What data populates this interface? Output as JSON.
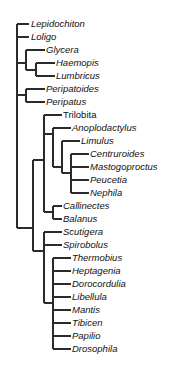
{
  "figure": {
    "type": "cladogram",
    "title": "",
    "background_color": "#ffffff",
    "line_color": "#2b2b2b",
    "text_color": "#111111",
    "width": 181,
    "height": 370
  },
  "chart_data": {
    "type": "tree",
    "title": "",
    "xlabel": "",
    "ylabel": "",
    "orientation": "left-to-right",
    "grid": false,
    "legend": false,
    "taxa": [
      {
        "label": "Lepidochiton",
        "italic": true,
        "x": 31,
        "y": 24,
        "tick_x": 22
      },
      {
        "label": "Loligo",
        "italic": true,
        "x": 31,
        "y": 37,
        "tick_x": 22
      },
      {
        "label": "Glycera",
        "italic": true,
        "x": 46,
        "y": 50,
        "tick_x": 38
      },
      {
        "label": "Haemopis",
        "italic": true,
        "x": 56,
        "y": 63,
        "tick_x": 48
      },
      {
        "label": "Lumbricus",
        "italic": true,
        "x": 56,
        "y": 76,
        "tick_x": 48
      },
      {
        "label": "Peripatoides",
        "italic": true,
        "x": 46,
        "y": 89,
        "tick_x": 38
      },
      {
        "label": "Peripatus",
        "italic": true,
        "x": 46,
        "y": 102,
        "tick_x": 38
      },
      {
        "label": "Trilobita",
        "italic": false,
        "x": 63,
        "y": 115,
        "tick_x": 55
      },
      {
        "label": "Anoplodactylus",
        "italic": true,
        "x": 72,
        "y": 128,
        "tick_x": 64
      },
      {
        "label": "Limulus",
        "italic": true,
        "x": 81,
        "y": 141,
        "tick_x": 73
      },
      {
        "label": "Centruroides",
        "italic": true,
        "x": 90,
        "y": 154,
        "tick_x": 82
      },
      {
        "label": "Mastogoproctus",
        "italic": true,
        "x": 90,
        "y": 167,
        "tick_x": 82
      },
      {
        "label": "Peucetia",
        "italic": true,
        "x": 90,
        "y": 180,
        "tick_x": 82
      },
      {
        "label": "Nephila",
        "italic": true,
        "x": 90,
        "y": 193,
        "tick_x": 82
      },
      {
        "label": "Callinectes",
        "italic": true,
        "x": 63,
        "y": 206,
        "tick_x": 55
      },
      {
        "label": "Balanus",
        "italic": true,
        "x": 63,
        "y": 219,
        "tick_x": 55
      },
      {
        "label": "Scutigera",
        "italic": true,
        "x": 63,
        "y": 232,
        "tick_x": 55
      },
      {
        "label": "Spirobolus",
        "italic": true,
        "x": 63,
        "y": 245,
        "tick_x": 55
      },
      {
        "label": "Thermobius",
        "italic": true,
        "x": 72,
        "y": 258,
        "tick_x": 64
      },
      {
        "label": "Heptagenia",
        "italic": true,
        "x": 72,
        "y": 271,
        "tick_x": 64
      },
      {
        "label": "Dorocordulia",
        "italic": true,
        "x": 72,
        "y": 284,
        "tick_x": 64
      },
      {
        "label": "Libellula",
        "italic": true,
        "x": 72,
        "y": 297,
        "tick_x": 64
      },
      {
        "label": "Mantis",
        "italic": true,
        "x": 72,
        "y": 310,
        "tick_x": 64
      },
      {
        "label": "Tibicen",
        "italic": true,
        "x": 72,
        "y": 323,
        "tick_x": 64
      },
      {
        "label": "Papilio",
        "italic": true,
        "x": 72,
        "y": 336,
        "tick_x": 64
      },
      {
        "label": "Drosophila",
        "italic": true,
        "x": 72,
        "y": 349,
        "tick_x": 64
      }
    ],
    "branches": [
      {
        "name": "root-spine",
        "x": 17,
        "y1": 24,
        "y2": 228
      },
      {
        "name": "stem-lepidochiton",
        "x1": 17,
        "x2": 29,
        "y": 24
      },
      {
        "name": "stem-loligo",
        "x1": 17,
        "x2": 29,
        "y": 37
      },
      {
        "name": "stem-annelida-node",
        "x1": 17,
        "x2": 26,
        "y": 63
      },
      {
        "name": "annelida-spine",
        "x": 26,
        "y1": 50,
        "y2": 70
      },
      {
        "name": "stem-glycera",
        "x1": 26,
        "x2": 45,
        "y": 50
      },
      {
        "name": "clitellata-stem",
        "x1": 26,
        "x2": 36,
        "y": 70
      },
      {
        "name": "clitellata-spine",
        "x": 36,
        "y1": 63,
        "y2": 76
      },
      {
        "name": "stem-haemopis",
        "x1": 36,
        "x2": 55,
        "y": 63
      },
      {
        "name": "stem-lumbricus",
        "x1": 36,
        "x2": 55,
        "y": 76
      },
      {
        "name": "stem-onychophora-node",
        "x1": 17,
        "x2": 26,
        "y": 95
      },
      {
        "name": "onychophora-spine",
        "x": 26,
        "y1": 89,
        "y2": 102
      },
      {
        "name": "stem-peripatoides",
        "x1": 26,
        "x2": 45,
        "y": 89
      },
      {
        "name": "stem-peripatus",
        "x1": 26,
        "x2": 45,
        "y": 102
      },
      {
        "name": "arthropoda-stem",
        "x1": 17,
        "x2": 33,
        "y": 228
      },
      {
        "name": "arthropoda-spine",
        "x": 33,
        "y1": 160,
        "y2": 251
      },
      {
        "name": "euarthropoda-stem",
        "x1": 33,
        "x2": 44,
        "y": 160
      },
      {
        "name": "euarthropoda-spine",
        "x": 44,
        "y1": 115,
        "y2": 212
      },
      {
        "name": "stem-trilobita",
        "x1": 44,
        "x2": 62,
        "y": 115
      },
      {
        "name": "chelicerata-stem",
        "x1": 44,
        "x2": 53,
        "y": 134
      },
      {
        "name": "chelicerata-spine",
        "x": 53,
        "y1": 128,
        "y2": 167
      },
      {
        "name": "stem-anoplodactylus",
        "x1": 53,
        "x2": 71,
        "y": 128
      },
      {
        "name": "euchelicerata-stem",
        "x1": 53,
        "x2": 62,
        "y": 167
      },
      {
        "name": "euchelicerata-spine",
        "x": 62,
        "y1": 141,
        "y2": 173
      },
      {
        "name": "stem-limulus",
        "x1": 62,
        "x2": 80,
        "y": 141
      },
      {
        "name": "arachnida-stem",
        "x1": 62,
        "x2": 71,
        "y": 173
      },
      {
        "name": "arachnida-spine",
        "x": 71,
        "y1": 154,
        "y2": 193
      },
      {
        "name": "stem-centruroides",
        "x1": 71,
        "x2": 89,
        "y": 154
      },
      {
        "name": "stem-mastogoproctus",
        "x1": 71,
        "x2": 89,
        "y": 167
      },
      {
        "name": "stem-peucetia",
        "x1": 71,
        "x2": 89,
        "y": 180
      },
      {
        "name": "stem-nephila",
        "x1": 71,
        "x2": 89,
        "y": 193
      },
      {
        "name": "crustacea-stem",
        "x1": 44,
        "x2": 53,
        "y": 212
      },
      {
        "name": "crustacea-spine",
        "x": 53,
        "y1": 206,
        "y2": 219
      },
      {
        "name": "stem-callinectes",
        "x1": 53,
        "x2": 62,
        "y": 206
      },
      {
        "name": "stem-balanus",
        "x1": 53,
        "x2": 62,
        "y": 219
      },
      {
        "name": "mandibulata-stem",
        "x1": 33,
        "x2": 44,
        "y": 251
      },
      {
        "name": "mandibulata-spine",
        "x": 44,
        "y1": 232,
        "y2": 303
      },
      {
        "name": "stem-scutigera",
        "x1": 44,
        "x2": 62,
        "y": 232
      },
      {
        "name": "stem-spirobolus",
        "x1": 44,
        "x2": 62,
        "y": 245
      },
      {
        "name": "insecta-stem",
        "x1": 44,
        "x2": 53,
        "y": 303
      },
      {
        "name": "insecta-spine",
        "x": 53,
        "y1": 258,
        "y2": 349
      },
      {
        "name": "stem-thermobius",
        "x1": 53,
        "x2": 71,
        "y": 258
      },
      {
        "name": "stem-heptagenia",
        "x1": 53,
        "x2": 71,
        "y": 271
      },
      {
        "name": "stem-dorocordulia",
        "x1": 53,
        "x2": 71,
        "y": 284
      },
      {
        "name": "stem-libellula",
        "x1": 53,
        "x2": 71,
        "y": 297
      },
      {
        "name": "stem-mantis",
        "x1": 53,
        "x2": 71,
        "y": 310
      },
      {
        "name": "stem-tibicen",
        "x1": 53,
        "x2": 71,
        "y": 323
      },
      {
        "name": "stem-papilio",
        "x1": 53,
        "x2": 71,
        "y": 336
      },
      {
        "name": "stem-drosophila",
        "x1": 53,
        "x2": 71,
        "y": 349
      }
    ]
  }
}
